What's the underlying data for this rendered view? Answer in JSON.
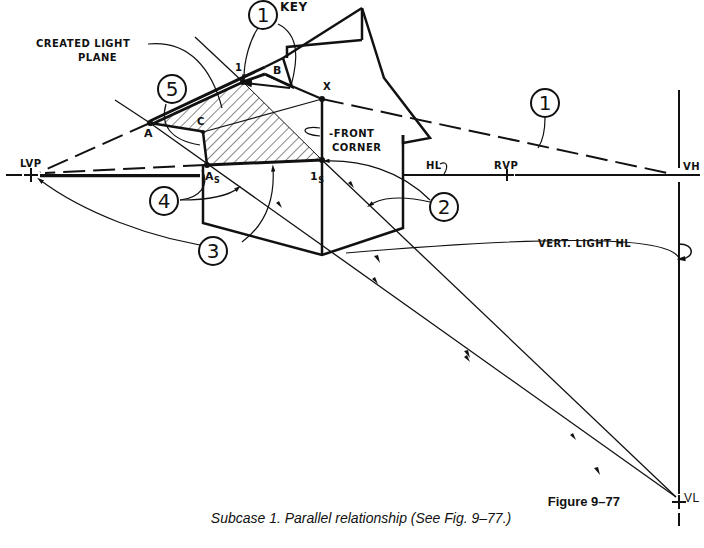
{
  "figure": {
    "number": "Figure 9–77",
    "caption": "Subcase 1.   Parallel relationship (See Fig. 9–77.)"
  },
  "labels": {
    "key": "KEY",
    "created_light_plane_1": "CREATED LIGHT",
    "created_light_plane_2": "PLANE",
    "front_corner_1": "-FRONT",
    "front_corner_2": "CORNER",
    "point_1": "1",
    "point_b": "B",
    "point_x": "X",
    "point_a": "A",
    "point_c": "C",
    "point_a_s": "A",
    "point_a_s_sub": "S",
    "point_1_s": "1",
    "point_1_s_sub": "S",
    "lvp": "LVP",
    "rvp": "RVP",
    "hl": "HL",
    "vh": "VH",
    "vl": "VL",
    "vert_light_hl": "VERT. LIGHT HL"
  },
  "callouts": [
    {
      "id": "1-top",
      "text": "1"
    },
    {
      "id": "5",
      "text": "5"
    },
    {
      "id": "4",
      "text": "4"
    },
    {
      "id": "3",
      "text": "3"
    },
    {
      "id": "2",
      "text": "2"
    },
    {
      "id": "1-right",
      "text": "1"
    }
  ],
  "colors": {
    "ink": "#111111",
    "paper": "#ffffff"
  }
}
